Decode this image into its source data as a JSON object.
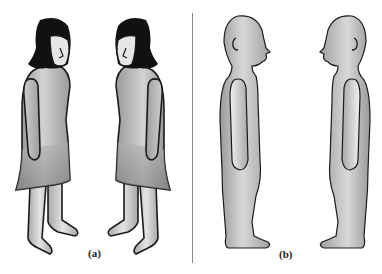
{
  "figure": {
    "panels": [
      {
        "id": "a",
        "caption": "(a)",
        "description": "Two cartoon women with dark hair and dresses facing each other"
      },
      {
        "id": "b",
        "caption": "(b)",
        "description": "Two bald mannequin-like figures in side profile facing each other"
      }
    ],
    "colors": {
      "outline": "#1a1a1a",
      "hair": "#111111",
      "skin_light": "#e6e6e6",
      "body_mid": "#b8b8b8",
      "body_dark": "#8e8e8e",
      "divider": "#8a8a8a",
      "background": "#ffffff"
    }
  }
}
